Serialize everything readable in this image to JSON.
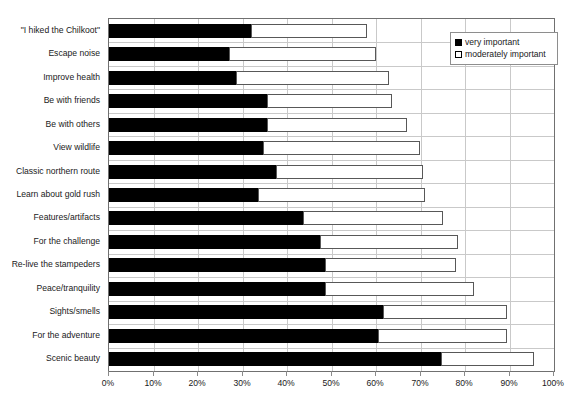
{
  "chart_data": {
    "type": "bar",
    "orientation": "horizontal",
    "stacked": true,
    "title": "",
    "xlabel": "",
    "ylabel": "",
    "xlim": [
      0,
      100
    ],
    "xtick_labels": [
      "0%",
      "10%",
      "20%",
      "30%",
      "40%",
      "50%",
      "60%",
      "70%",
      "80%",
      "90%",
      "100%"
    ],
    "xticks": [
      0,
      10,
      20,
      30,
      40,
      50,
      60,
      70,
      80,
      90,
      100
    ],
    "grid": true,
    "legend_position": "top-right",
    "categories": [
      "\"I hiked the Chilkoot\"",
      "Escape noise",
      "Improve health",
      "Be with friends",
      "Be with others",
      "View wildlife",
      "Classic northern route",
      "Learn about gold rush",
      "Features/artifacts",
      "For the challenge",
      "Re-live the stampeders",
      "Peace/tranquility",
      "Sights/smells",
      "For the adventure",
      "Scenic beauty"
    ],
    "series": [
      {
        "name": "very important",
        "color": "#000000",
        "values": [
          32,
          27,
          28.5,
          35.5,
          35.5,
          34.5,
          37.5,
          33.5,
          43.5,
          47.5,
          48.5,
          48.5,
          61.5,
          60.5,
          74.5
        ]
      },
      {
        "name": "moderately important",
        "color": "#ffffff",
        "values": [
          26,
          33,
          34.5,
          28,
          31.5,
          35.5,
          33,
          37.5,
          31.5,
          31,
          29.5,
          33.5,
          28,
          29,
          21
        ]
      }
    ],
    "cumulative_totals": [
      58,
      60,
      63,
      63.5,
      67,
      70,
      70.5,
      71,
      75,
      78.5,
      78,
      82,
      89.5,
      89.5,
      95.5
    ]
  },
  "legend": {
    "items": [
      {
        "label": "very important",
        "swatch": "filled-square"
      },
      {
        "label": "moderately important",
        "swatch": "open-square"
      }
    ]
  }
}
